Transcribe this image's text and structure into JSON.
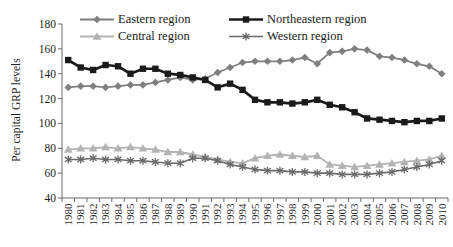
{
  "chart_data": {
    "type": "line",
    "title": "",
    "ylabel": "Per capital GRP levels",
    "xlabel": "",
    "ylim": [
      40,
      180
    ],
    "ytick_step": 20,
    "grid": false,
    "legend_position": "top",
    "background": "#ffffff",
    "axis_color": "#6b6b6b",
    "text_color": "#1f1f1f",
    "categories": [
      "1980",
      "1981",
      "1982",
      "1983",
      "1984",
      "1985",
      "1986",
      "1987",
      "1988",
      "1989",
      "1990",
      "1991",
      "1992",
      "1993",
      "1994",
      "1995",
      "1996",
      "1997",
      "1998",
      "1999",
      "2000",
      "2001",
      "2002",
      "2003",
      "2004",
      "2005",
      "2006",
      "2007",
      "2008",
      "2009",
      "2010"
    ],
    "series": [
      {
        "name": "Eastern region",
        "marker": "diamond",
        "color": "#7f7f7f",
        "line_width": 1.8,
        "values": [
          129,
          130,
          130,
          129,
          130,
          131,
          131,
          133,
          135,
          137,
          135,
          136,
          141,
          145,
          149,
          150,
          150,
          150,
          151,
          153,
          148,
          157,
          158,
          160,
          159,
          154,
          153,
          151,
          148,
          146,
          140
        ]
      },
      {
        "name": "Northeastern region",
        "marker": "square",
        "color": "#1a1a1a",
        "line_width": 2.7,
        "values": [
          151,
          145,
          143,
          147,
          146,
          140,
          144,
          144,
          140,
          139,
          137,
          135,
          129,
          132,
          127,
          119,
          117,
          117,
          116,
          117,
          119,
          115,
          113,
          109,
          104,
          103,
          102,
          101,
          102,
          102,
          104
        ]
      },
      {
        "name": "Central region",
        "marker": "triangle",
        "color": "#b3b3b3",
        "line_width": 1.8,
        "values": [
          79,
          80,
          80,
          81,
          80,
          81,
          80,
          79,
          77,
          77,
          75,
          73,
          71,
          69,
          68,
          72,
          74,
          75,
          74,
          73,
          74,
          67,
          66,
          65,
          66,
          67,
          68,
          69,
          70,
          71,
          74
        ]
      },
      {
        "name": "Western region",
        "marker": "asterisk",
        "color": "#6a6a6a",
        "line_width": 1.6,
        "values": [
          71,
          71,
          72,
          71,
          71,
          70,
          70,
          69,
          68,
          68,
          72,
          72,
          70,
          67,
          65,
          63,
          62,
          62,
          61,
          61,
          60,
          60,
          59,
          59,
          59,
          60,
          61,
          63,
          65,
          67,
          70
        ]
      }
    ],
    "draw_order": [
      2,
      3,
      0,
      1
    ]
  }
}
